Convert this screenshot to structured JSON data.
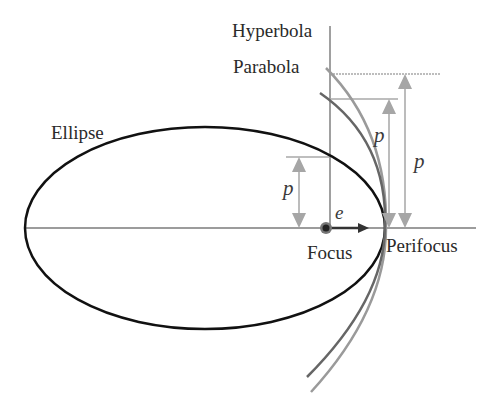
{
  "diagram": {
    "labels": {
      "ellipse": "Ellipse",
      "parabola": "Parabola",
      "hyperbola": "Hyperbola",
      "focus": "Focus",
      "perifocus": "Perifocus",
      "eccentricity_vector": "e",
      "semi_latus_rectum_ellipse": "p",
      "semi_latus_rectum_parabola": "p",
      "semi_latus_rectum_hyperbola": "p"
    },
    "colors": {
      "ellipse": "#111111",
      "parabola": "#666666",
      "hyperbola": "#9a9a9a",
      "axes": "#9a9a9a",
      "arrows": "#a6a6a6",
      "e_vector": "#333333",
      "text": "#2a2a2a"
    },
    "geometry": {
      "focus": [
        325,
        228
      ],
      "perifocus": [
        385,
        228
      ],
      "ellipse_center": [
        205,
        228
      ],
      "ellipse_radii": [
        180,
        101
      ]
    }
  }
}
